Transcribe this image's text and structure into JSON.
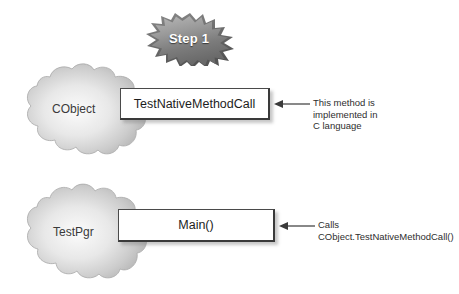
{
  "diagram": {
    "background_color": "#ffffff",
    "step_badge": {
      "label": "Step 1",
      "icon": "starburst-badge-icon",
      "fill_color": "#8e8e8e",
      "text_color": "#ffffff"
    },
    "nodes": [
      {
        "id": "cobject",
        "cloud_label": "CObject",
        "cloud_icon": "cloud-blob-icon",
        "cloud_color": "#cfcfcf",
        "method_label": "TestNativeMethodCall",
        "annotation_lines": [
          "This method is",
          "implemented in",
          "C language"
        ],
        "arrow_icon": "arrow-left-icon"
      },
      {
        "id": "testpgr",
        "cloud_label": "TestPgr",
        "cloud_icon": "cloud-blob-icon",
        "cloud_color": "#cfcfcf",
        "method_label": "Main()",
        "annotation_lines": [
          "Calls",
          "CObject.TestNativeMethodCall()"
        ],
        "arrow_icon": "arrow-left-icon"
      }
    ]
  }
}
